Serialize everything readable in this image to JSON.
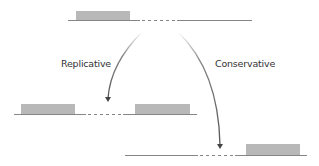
{
  "diagram": {
    "title": "",
    "labels": {
      "replicative": "Replicative",
      "conservative": "Conservative"
    },
    "nodes": [
      {
        "id": "donor-chromosome",
        "description": "Original chromosome with transposon (gray box) followed by dashed target region"
      },
      {
        "id": "replicative-product",
        "description": "Transposon copy retained at original site and inserted at target site"
      },
      {
        "id": "conservative-product",
        "description": "Transposon excised from original site and moved to target site"
      }
    ],
    "edges": [
      {
        "from": "donor-chromosome",
        "to": "replicative-product",
        "label": "Replicative"
      },
      {
        "from": "donor-chromosome",
        "to": "conservative-product",
        "label": "Conservative"
      }
    ],
    "colors": {
      "transposon": "#b8b8b8",
      "line": "#555555",
      "arrow": "#666666",
      "text": "#333333"
    }
  }
}
